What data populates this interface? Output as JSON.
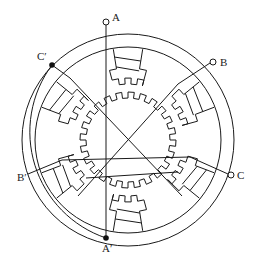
{
  "diagram": {
    "type": "three-phase variable reluctance stepper motor cross-section",
    "background": "#ffffff",
    "line_color": "#1a1a1a",
    "center": [
      128,
      140
    ],
    "stator": {
      "outer_radius": 106,
      "inner_radius": 92,
      "poles": 6,
      "teeth_per_pole": 3
    },
    "rotor": {
      "radius": 48,
      "teeth": 24
    },
    "terminals": [
      {
        "id": "A",
        "label": "A",
        "kind": "open",
        "x": 106,
        "y": 22
      },
      {
        "id": "B",
        "label": "B",
        "kind": "open",
        "x": 213,
        "y": 62
      },
      {
        "id": "C",
        "label": "C",
        "kind": "open",
        "x": 231,
        "y": 175
      },
      {
        "id": "A2",
        "label": "A′",
        "kind": "filled",
        "x": 106,
        "y": 238
      },
      {
        "id": "B2",
        "label": "B′",
        "kind": "none",
        "x": 28,
        "y": 172
      },
      {
        "id": "C2",
        "label": "C′",
        "kind": "filled",
        "x": 52,
        "y": 65
      }
    ]
  },
  "labels": {
    "A": "A",
    "B": "B",
    "C": "C",
    "A_prime": "A′",
    "B_prime": "B′",
    "C_prime": "C′"
  }
}
